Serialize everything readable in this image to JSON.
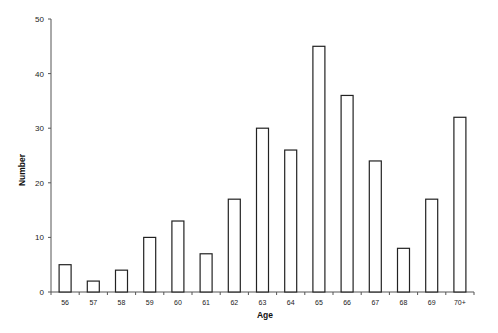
{
  "chart_data": {
    "type": "bar",
    "title": "",
    "xlabel": "Age",
    "ylabel": "Number",
    "categories": [
      "56",
      "57",
      "58",
      "59",
      "60",
      "61",
      "62",
      "63",
      "64",
      "65",
      "66",
      "67",
      "68",
      "69",
      "70+"
    ],
    "values": [
      5,
      2,
      4,
      10,
      13,
      7,
      17,
      30,
      26,
      45,
      36,
      24,
      8,
      17,
      32
    ],
    "ylim": [
      0,
      50
    ],
    "yticks": [
      0,
      10,
      20,
      30,
      40,
      50
    ],
    "grid": false,
    "legend": null,
    "bar_fill": "#ffffff",
    "bar_stroke": "#222222"
  }
}
